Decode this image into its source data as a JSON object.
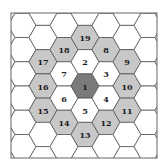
{
  "diagram": {
    "type": "hexagonal-spiral-numbering",
    "colors": {
      "background": "#ffffff",
      "frame": "#666666",
      "grid_line": "#555555",
      "center_fill": "#7a7a7a",
      "ring1_fill": "#ffffff",
      "ring2_fill": "#c8c8c8",
      "empty_fill": "#ffffff"
    },
    "frame": {
      "x": 11,
      "y": 13,
      "width": 146,
      "height": 145
    },
    "hex_radius": 14,
    "center": {
      "x": 85,
      "y": 86
    },
    "labeled_cells": [
      {
        "label": "1",
        "ring": 0,
        "col": 0,
        "row": 0
      },
      {
        "label": "2",
        "ring": 1,
        "col": 0,
        "row": -1
      },
      {
        "label": "3",
        "ring": 1,
        "col": 1,
        "row": -0.5
      },
      {
        "label": "4",
        "ring": 1,
        "col": 1,
        "row": 0.5
      },
      {
        "label": "5",
        "ring": 1,
        "col": 0,
        "row": 1
      },
      {
        "label": "6",
        "ring": 1,
        "col": -1,
        "row": 0.5
      },
      {
        "label": "7",
        "ring": 1,
        "col": -1,
        "row": -0.5
      },
      {
        "label": "8",
        "ring": 2,
        "col": 1,
        "row": -1.5
      },
      {
        "label": "9",
        "ring": 2,
        "col": 2,
        "row": -1
      },
      {
        "label": "10",
        "ring": 2,
        "col": 2,
        "row": 0
      },
      {
        "label": "11",
        "ring": 2,
        "col": 2,
        "row": 1
      },
      {
        "label": "12",
        "ring": 2,
        "col": 1,
        "row": 1.5
      },
      {
        "label": "13",
        "ring": 2,
        "col": 0,
        "row": 2
      },
      {
        "label": "14",
        "ring": 2,
        "col": -1,
        "row": 1.5
      },
      {
        "label": "15",
        "ring": 2,
        "col": -2,
        "row": 1
      },
      {
        "label": "16",
        "ring": 2,
        "col": -2,
        "row": 0
      },
      {
        "label": "17",
        "ring": 2,
        "col": -2,
        "row": -1
      },
      {
        "label": "18",
        "ring": 2,
        "col": -1,
        "row": -1.5
      },
      {
        "label": "19",
        "ring": 2,
        "col": 0,
        "row": -2
      }
    ]
  }
}
